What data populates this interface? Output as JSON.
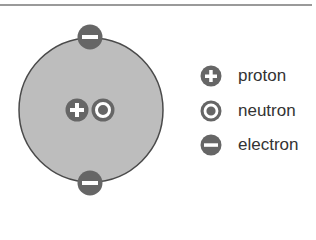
{
  "diagram": {
    "title": "",
    "atom": {
      "nucleus": [
        {
          "type": "proton",
          "symbol": "+"
        },
        {
          "type": "neutron",
          "symbol": "o"
        }
      ],
      "electrons": [
        {
          "position": "top",
          "symbol": "-"
        },
        {
          "position": "bottom",
          "symbol": "-"
        }
      ]
    },
    "legend": {
      "items": [
        {
          "icon": "plus-circle-icon",
          "label": "proton"
        },
        {
          "icon": "dot-circle-icon",
          "label": "neutron"
        },
        {
          "icon": "minus-circle-icon",
          "label": "electron"
        }
      ]
    },
    "colors": {
      "atom_fill": "#bdbdbd",
      "atom_stroke": "#4a4a4a",
      "particle": "#666666",
      "glyph": "#ffffff",
      "text": "#333333"
    }
  }
}
